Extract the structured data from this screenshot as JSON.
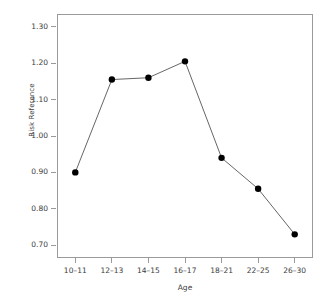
{
  "chart_data": {
    "type": "line",
    "title": "",
    "xlabel": "Age",
    "ylabel": "Risk Reference",
    "categories": [
      "10–11",
      "12–13",
      "14–15",
      "16–17",
      "18–21",
      "22–25",
      "26–30"
    ],
    "values": [
      0.9,
      1.155,
      1.16,
      1.205,
      0.94,
      0.855,
      0.73
    ],
    "series": [
      {
        "name": "Risk Reference",
        "values": [
          0.9,
          1.155,
          1.16,
          1.205,
          0.94,
          0.855,
          0.73
        ]
      }
    ],
    "ylim": [
      0.665,
      1.335
    ],
    "yticks": [
      1.3,
      1.2,
      1.1,
      1.0,
      0.9,
      0.8,
      0.7
    ],
    "ytick_labels": [
      "1.30",
      "1.20",
      "1.10",
      "1.00",
      "0.90",
      "0.80",
      "0.70"
    ],
    "xtick_labels": [
      "10–11",
      "12–13",
      "14–15",
      "16–17",
      "18–21",
      "22–25",
      "26–30"
    ],
    "grid": false,
    "legend": false,
    "legend_position": "none",
    "marker": "filled-circle",
    "marker_color": "#000000",
    "line_color": "#555555",
    "frame_color": "#9a9a9a",
    "background": "#ffffff"
  },
  "axes": {
    "y_label": "Risk Reference",
    "x_label": "Age"
  }
}
